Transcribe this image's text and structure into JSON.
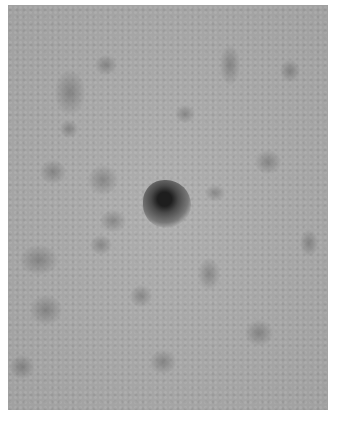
{
  "image": {
    "description": "Grayscale close-up photograph of mottled skin surface with a small dark pigmented lesion near the center",
    "colors": {
      "background": "#ffffff",
      "skin_base": "#a9a9a9",
      "mottling": "#7e7e7e",
      "lesion_core": "#1e1e1e"
    },
    "lesion": {
      "x": 159,
      "y": 204,
      "diameter": 48
    },
    "mottle_spots": [
      {
        "x": 55,
        "y": 70,
        "w": 30,
        "h": 45
      },
      {
        "x": 95,
        "y": 55,
        "w": 22,
        "h": 20
      },
      {
        "x": 40,
        "y": 160,
        "w": 26,
        "h": 24
      },
      {
        "x": 88,
        "y": 165,
        "w": 30,
        "h": 30
      },
      {
        "x": 100,
        "y": 210,
        "w": 26,
        "h": 22
      },
      {
        "x": 20,
        "y": 245,
        "w": 38,
        "h": 30
      },
      {
        "x": 90,
        "y": 235,
        "w": 22,
        "h": 20
      },
      {
        "x": 198,
        "y": 258,
        "w": 22,
        "h": 32
      },
      {
        "x": 30,
        "y": 295,
        "w": 32,
        "h": 30
      },
      {
        "x": 130,
        "y": 285,
        "w": 22,
        "h": 22
      },
      {
        "x": 255,
        "y": 150,
        "w": 26,
        "h": 24
      },
      {
        "x": 280,
        "y": 60,
        "w": 20,
        "h": 22
      },
      {
        "x": 220,
        "y": 45,
        "w": 20,
        "h": 40
      },
      {
        "x": 245,
        "y": 320,
        "w": 28,
        "h": 26
      },
      {
        "x": 10,
        "y": 355,
        "w": 24,
        "h": 24
      },
      {
        "x": 150,
        "y": 350,
        "w": 26,
        "h": 24
      },
      {
        "x": 300,
        "y": 230,
        "w": 18,
        "h": 26
      },
      {
        "x": 175,
        "y": 105,
        "w": 20,
        "h": 18
      },
      {
        "x": 60,
        "y": 120,
        "w": 18,
        "h": 18
      },
      {
        "x": 205,
        "y": 185,
        "w": 20,
        "h": 16
      }
    ]
  }
}
